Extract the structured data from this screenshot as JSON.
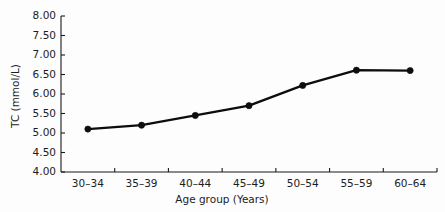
{
  "chart_data": {
    "type": "line",
    "title": "",
    "xlabel": "Age group (Years)",
    "ylabel": "TC (mmol/L)",
    "categories": [
      "30–34",
      "35–39",
      "40–44",
      "45–49",
      "50–54",
      "55–59",
      "60–64"
    ],
    "values": [
      5.1,
      5.2,
      5.45,
      5.7,
      6.22,
      6.61,
      6.6
    ],
    "ylim": [
      4.0,
      8.0
    ],
    "ytick_values": [
      4.0,
      4.5,
      5.0,
      5.5,
      6.0,
      6.5,
      7.0,
      7.5,
      8.0
    ],
    "ytick_labels": [
      "4.00",
      "4.50",
      "5.00",
      "5.50",
      "6.00",
      "6.50",
      "7.00",
      "7.50",
      "8.00"
    ],
    "grid": false,
    "legend": null,
    "marker": "filled-circle",
    "series_color": "#0d0d0d",
    "axis_color": "#1a1a1a",
    "background_color": "#fdfdfd",
    "series": [
      {
        "name": "TC",
        "values": [
          5.1,
          5.2,
          5.45,
          5.7,
          6.22,
          6.61,
          6.6
        ]
      }
    ]
  }
}
